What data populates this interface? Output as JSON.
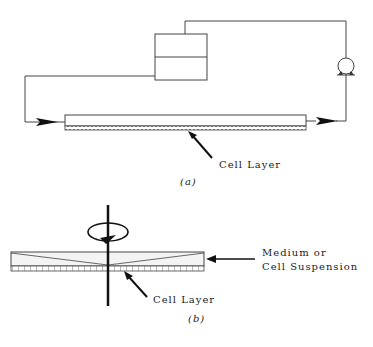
{
  "figure_a": {
    "label_cell_layer": "Cell Layer",
    "caption": "(a)",
    "components": [
      "reservoir",
      "pump",
      "flow-channel",
      "cell-layer",
      "inlet-arrow",
      "outlet-arrow"
    ]
  },
  "figure_b": {
    "label_medium": "Medium or",
    "label_medium_2": "Cell Suspension",
    "label_cell_layer": "Cell Layer",
    "caption": "(b)",
    "components": [
      "rotating-shaft",
      "rotation-arrow",
      "cone-plate",
      "cell-layer"
    ]
  },
  "colors": {
    "line": "#444444",
    "fill_light": "#f4f4f4",
    "arrow": "#111111"
  }
}
